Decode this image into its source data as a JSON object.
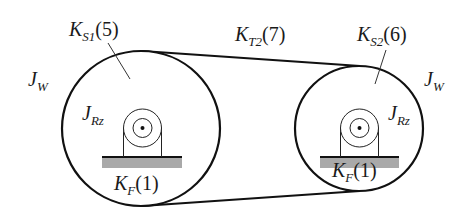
{
  "diagram": {
    "type": "belt drive stiffness/inertia schematic",
    "belt": {
      "name": "K",
      "sub": "T2",
      "index": "(7)"
    },
    "left_pulley": {
      "inertia": {
        "name": "J",
        "sub": "W"
      },
      "spring": {
        "name": "K",
        "sub": "S1",
        "index": "(5)"
      },
      "rotor_inertia": {
        "name": "J",
        "sub": "Rz"
      },
      "foundation": {
        "name": "K",
        "sub": "F",
        "index": "(1)"
      }
    },
    "right_pulley": {
      "inertia": {
        "name": "J",
        "sub": "W"
      },
      "spring": {
        "name": "K",
        "sub": "S2",
        "index": "(6)"
      },
      "rotor_inertia": {
        "name": "J",
        "sub": "Rz"
      },
      "foundation": {
        "name": "K",
        "sub": "F",
        "index": "(1)"
      }
    },
    "colors": {
      "stroke": "#111111",
      "base_fill": "#a9a9a9",
      "text": "#1a1a1a"
    }
  }
}
